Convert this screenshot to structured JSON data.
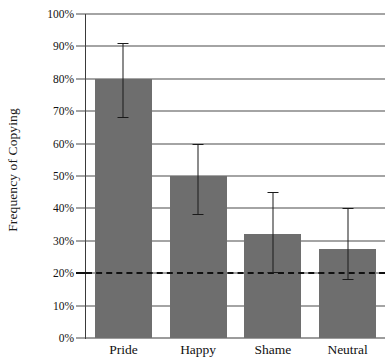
{
  "chart_data": {
    "type": "bar",
    "title": "",
    "xlabel": "",
    "ylabel": "Frequency of Copying",
    "categories": [
      "Pride",
      "Happy",
      "Shame",
      "Neutral"
    ],
    "values": [
      80,
      50,
      32,
      27.5
    ],
    "error_low": [
      68,
      38,
      20,
      18
    ],
    "error_high": [
      91,
      60,
      45,
      40
    ],
    "ylim": [
      0,
      100
    ],
    "ytick_labels": [
      "0%",
      "10%",
      "20%",
      "30%",
      "40%",
      "50%",
      "60%",
      "70%",
      "80%",
      "90%",
      "100%"
    ],
    "ytick_values": [
      0,
      10,
      20,
      30,
      40,
      50,
      60,
      70,
      80,
      90,
      100
    ],
    "grid": "horizontal",
    "legend": "none",
    "reference_line": {
      "value": 20,
      "style": "dashed",
      "label": ""
    },
    "series": [
      {
        "name": "Frequency of Copying",
        "color": "#6e6e6e",
        "values": [
          80,
          50,
          32,
          27.5
        ]
      }
    ],
    "bar_color": "#6e6e6e",
    "axis_color": "#3a3a3a"
  }
}
